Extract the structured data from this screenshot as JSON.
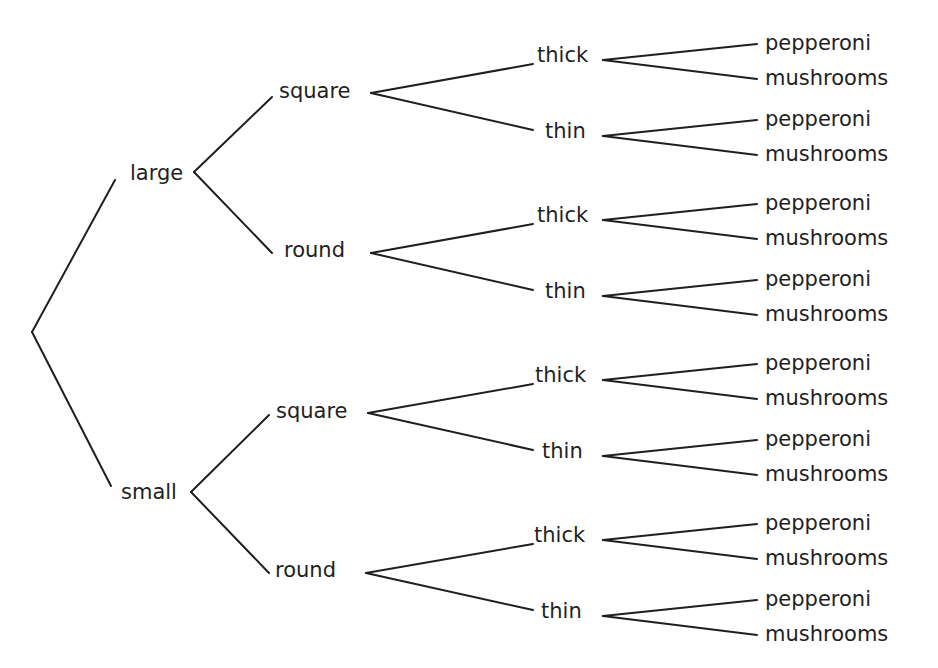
{
  "diagram": {
    "type": "tree",
    "title": "",
    "root": {
      "label": "",
      "children": [
        {
          "label": "large",
          "children": [
            {
              "label": "square",
              "children": [
                {
                  "label": "thick",
                  "children": [
                    {
                      "label": "pepperoni"
                    },
                    {
                      "label": "mushrooms"
                    }
                  ]
                },
                {
                  "label": "thin",
                  "children": [
                    {
                      "label": "pepperoni"
                    },
                    {
                      "label": "mushrooms"
                    }
                  ]
                }
              ]
            },
            {
              "label": "round",
              "children": [
                {
                  "label": "thick",
                  "children": [
                    {
                      "label": "pepperoni"
                    },
                    {
                      "label": "mushrooms"
                    }
                  ]
                },
                {
                  "label": "thin",
                  "children": [
                    {
                      "label": "pepperoni"
                    },
                    {
                      "label": "mushrooms"
                    }
                  ]
                }
              ]
            }
          ]
        },
        {
          "label": "small",
          "children": [
            {
              "label": "square",
              "children": [
                {
                  "label": "thick",
                  "children": [
                    {
                      "label": "pepperoni"
                    },
                    {
                      "label": "mushrooms"
                    }
                  ]
                },
                {
                  "label": "thin",
                  "children": [
                    {
                      "label": "pepperoni"
                    },
                    {
                      "label": "mushrooms"
                    }
                  ]
                }
              ]
            },
            {
              "label": "round",
              "children": [
                {
                  "label": "thick",
                  "children": [
                    {
                      "label": "pepperoni"
                    },
                    {
                      "label": "mushrooms"
                    }
                  ]
                },
                {
                  "label": "thin",
                  "children": [
                    {
                      "label": "pepperoni"
                    },
                    {
                      "label": "mushrooms"
                    }
                  ]
                }
              ]
            }
          ]
        }
      ]
    },
    "levels": {
      "size": [
        "large",
        "small"
      ],
      "shape": [
        "square",
        "round"
      ],
      "crust": [
        "thick",
        "thin"
      ],
      "topping": [
        "pepperoni",
        "mushrooms"
      ]
    },
    "line_color": "#1f1f1f",
    "text_color": "#1f1f1f",
    "background": "#ffffff"
  }
}
